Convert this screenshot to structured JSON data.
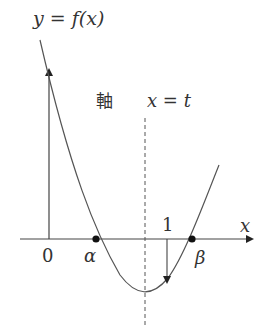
{
  "diagram": {
    "function_label": "y = f(x)",
    "axis_word": "軸",
    "axis_equation": "x = t",
    "x_axis_label": "x",
    "origin_label": "0",
    "tick_one_label": "1",
    "root_alpha_label": "α",
    "root_beta_label": "β",
    "colors": {
      "ink": "#333333",
      "curve": "#555555",
      "background": "#ffffff"
    }
  }
}
